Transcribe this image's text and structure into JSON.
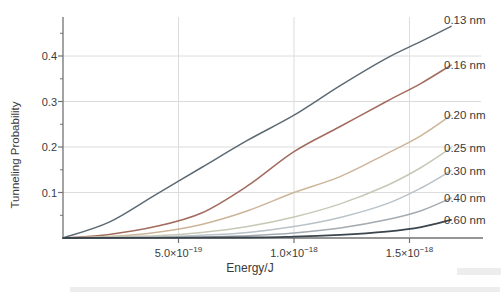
{
  "figure": {
    "background": "#ffffff"
  },
  "chart_data": {
    "type": "line",
    "title": "",
    "xlabel": "Energy/J",
    "ylabel": "Tunneling Probability",
    "xlim": [
      0,
      1.8e-18
    ],
    "ylim": [
      0,
      0.486
    ],
    "grid": true,
    "grid_color": "#dcdcdc",
    "axis_color": "#737373",
    "legend_position": "labels-at-curve-ends-right",
    "x_ticks": [
      {
        "value": 5e-19,
        "mantissa": "5.0×10",
        "exponent": "−19",
        "display": "5.0×10⁻¹⁹"
      },
      {
        "value": 1e-18,
        "mantissa": "1.0×10",
        "exponent": "−18",
        "display": "1.0×10⁻¹⁸"
      },
      {
        "value": 1.5e-18,
        "mantissa": "1.5×10",
        "exponent": "−18",
        "display": "1.5×10⁻¹⁸"
      }
    ],
    "y_ticks": [
      {
        "value": 0.1,
        "label": "0.1"
      },
      {
        "value": 0.2,
        "label": "0.2"
      },
      {
        "value": 0.3,
        "label": "0.3"
      },
      {
        "value": 0.4,
        "label": "0.4"
      }
    ],
    "y_minor_ticks": [
      0.05,
      0.15,
      0.25,
      0.35,
      0.45
    ],
    "energy_unit_note": "series point E values are in units of 1e-18 J",
    "series": [
      {
        "name": "0.13 nm",
        "color": "#5d6a73",
        "width": 1.5,
        "label_dy": -6,
        "points": [
          [
            0,
            0
          ],
          [
            0.2,
            0.035
          ],
          [
            0.4,
            0.095
          ],
          [
            0.6,
            0.155
          ],
          [
            0.8,
            0.215
          ],
          [
            1.0,
            0.27
          ],
          [
            1.2,
            0.335
          ],
          [
            1.4,
            0.395
          ],
          [
            1.55,
            0.432
          ],
          [
            1.68,
            0.465
          ]
        ]
      },
      {
        "name": "0.16 nm",
        "color": "#a26b5d",
        "width": 1.5,
        "label_dy": 0,
        "points": [
          [
            0,
            0
          ],
          [
            0.2,
            0.008
          ],
          [
            0.4,
            0.025
          ],
          [
            0.6,
            0.055
          ],
          [
            0.8,
            0.115
          ],
          [
            1.0,
            0.19
          ],
          [
            1.2,
            0.245
          ],
          [
            1.4,
            0.3
          ],
          [
            1.55,
            0.34
          ],
          [
            1.68,
            0.38
          ]
        ]
      },
      {
        "name": "0.20 nm",
        "color": "#ccb598",
        "width": 1.5,
        "label_dy": 0,
        "points": [
          [
            0,
            0
          ],
          [
            0.2,
            0.003
          ],
          [
            0.4,
            0.012
          ],
          [
            0.6,
            0.03
          ],
          [
            0.8,
            0.06
          ],
          [
            1.0,
            0.1
          ],
          [
            1.2,
            0.135
          ],
          [
            1.4,
            0.185
          ],
          [
            1.55,
            0.225
          ],
          [
            1.68,
            0.27
          ]
        ]
      },
      {
        "name": "0.25 nm",
        "color": "#c6c9b6",
        "width": 1.5,
        "label_dy": 0,
        "points": [
          [
            0,
            0
          ],
          [
            0.4,
            0.005
          ],
          [
            0.6,
            0.012
          ],
          [
            0.8,
            0.025
          ],
          [
            1.0,
            0.046
          ],
          [
            1.2,
            0.075
          ],
          [
            1.4,
            0.115
          ],
          [
            1.55,
            0.155
          ],
          [
            1.68,
            0.198
          ]
        ]
      },
      {
        "name": "0.30 nm",
        "color": "#b8c2c8",
        "width": 1.5,
        "label_dy": 0,
        "points": [
          [
            0,
            0
          ],
          [
            0.4,
            0.002
          ],
          [
            0.6,
            0.006
          ],
          [
            0.8,
            0.012
          ],
          [
            1.0,
            0.025
          ],
          [
            1.2,
            0.045
          ],
          [
            1.4,
            0.075
          ],
          [
            1.55,
            0.11
          ],
          [
            1.68,
            0.148
          ]
        ]
      },
      {
        "name": "0.40 nm",
        "color": "#a4abb0",
        "width": 1.5,
        "label_dy": 0,
        "points": [
          [
            0,
            0
          ],
          [
            0.6,
            0.002
          ],
          [
            0.8,
            0.005
          ],
          [
            1.0,
            0.011
          ],
          [
            1.2,
            0.022
          ],
          [
            1.4,
            0.04
          ],
          [
            1.55,
            0.06
          ],
          [
            1.68,
            0.088
          ]
        ]
      },
      {
        "name": "0.60 nm",
        "color": "#3b454d",
        "width": 1.8,
        "label_dy": 0,
        "points": [
          [
            0,
            0
          ],
          [
            0.8,
            0.001
          ],
          [
            1.0,
            0.003
          ],
          [
            1.2,
            0.007
          ],
          [
            1.4,
            0.014
          ],
          [
            1.55,
            0.024
          ],
          [
            1.68,
            0.04
          ]
        ]
      }
    ]
  }
}
